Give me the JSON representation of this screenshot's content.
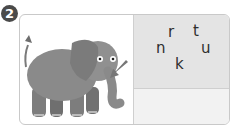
{
  "exercise": {
    "number": "2",
    "picture": "elephant",
    "pointer": "arrow-pointing-to-trunk",
    "letters": [
      "r",
      "t",
      "n",
      "u",
      "k"
    ],
    "answer": ""
  },
  "colors": {
    "letters_panel": "#e4e4e4",
    "answer_panel": "#f2f2f2",
    "border": "#c9c9c9",
    "elephant": "#8a8a8a"
  }
}
